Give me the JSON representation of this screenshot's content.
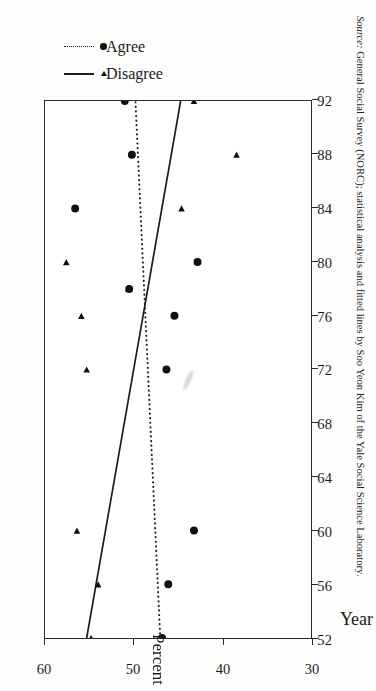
{
  "figure": {
    "caption_source_word": "Source:",
    "caption_text": " General Social Survey (NORC); statistical analysis and fitted lines by Soo Yeon Kim of the Yale Social Science Laboratory.",
    "axis_title_x": "Year",
    "axis_title_y": "Percent"
  },
  "legend": {
    "entries": [
      {
        "label": "Disagree",
        "line_style": "solid",
        "marker": "triangle"
      },
      {
        "label": "Agree",
        "line_style": "dotted",
        "marker": "circle"
      }
    ]
  },
  "chart_data": {
    "type": "scatter",
    "title": "",
    "xlabel": "Year",
    "ylabel": "Percent",
    "xlim": [
      52,
      92
    ],
    "ylim": [
      30,
      60
    ],
    "xticks": [
      52,
      56,
      60,
      64,
      68,
      72,
      76,
      80,
      84,
      88,
      92
    ],
    "yticks": [
      30,
      40,
      50,
      60
    ],
    "grid": false,
    "legend_position": "right",
    "orientation": "rotated-90",
    "series": [
      {
        "name": "Disagree",
        "marker": "triangle",
        "fit_line_style": "solid",
        "points": [
          {
            "x": 52,
            "y": 54.8
          },
          {
            "x": 56,
            "y": 54.0
          },
          {
            "x": 60,
            "y": 56.4
          },
          {
            "x": 72,
            "y": 55.3
          },
          {
            "x": 76,
            "y": 55.9
          },
          {
            "x": 78,
            "y": 50.6
          },
          {
            "x": 80,
            "y": 57.6
          },
          {
            "x": 84,
            "y": 44.6
          },
          {
            "x": 88,
            "y": 38.4
          },
          {
            "x": 92,
            "y": 43.2
          }
        ],
        "fit_line": {
          "x": [
            52,
            92
          ],
          "y": [
            55.3,
            44.7
          ]
        }
      },
      {
        "name": "Agree",
        "marker": "circle",
        "fit_line_style": "dotted",
        "points": [
          {
            "x": 52,
            "y": 46.8
          },
          {
            "x": 56,
            "y": 46.1
          },
          {
            "x": 60,
            "y": 43.2
          },
          {
            "x": 72,
            "y": 46.3
          },
          {
            "x": 76,
            "y": 45.4
          },
          {
            "x": 78,
            "y": 50.5
          },
          {
            "x": 80,
            "y": 42.8
          },
          {
            "x": 84,
            "y": 56.6
          },
          {
            "x": 88,
            "y": 50.2
          },
          {
            "x": 92,
            "y": 51.0
          }
        ],
        "fit_line": {
          "x": [
            52,
            92
          ],
          "y": [
            47.0,
            49.8
          ]
        }
      }
    ]
  }
}
